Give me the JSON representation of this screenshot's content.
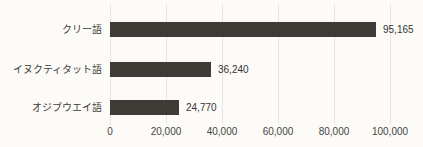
{
  "chart_data": {
    "type": "bar",
    "orientation": "horizontal",
    "title": "",
    "xlabel": "",
    "ylabel": "",
    "categories": [
      "クリー語",
      "イヌクティタット語",
      "オジブウエイ語"
    ],
    "values": [
      95165,
      36240,
      24770
    ],
    "value_labels": [
      "95,165",
      "36,240",
      "24,770"
    ],
    "x_ticks": [
      0,
      20000,
      40000,
      60000,
      80000,
      100000
    ],
    "x_tick_labels": [
      "0",
      "20,000",
      "40,000",
      "60,000",
      "80,000",
      "100,000"
    ],
    "xlim": [
      0,
      100000
    ],
    "grid": "vertical-gridlines-on",
    "legend": "none",
    "colors": {
      "bar_fill": "#3e3a35",
      "gridline": "#e7e5e0",
      "text": "#3c3c3c",
      "background": "#fcfbf8"
    }
  }
}
